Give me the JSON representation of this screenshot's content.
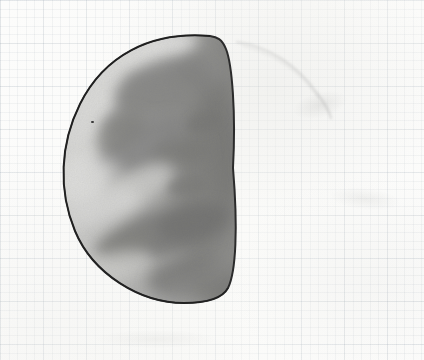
{
  "medium": {
    "support": "graph paper",
    "technique": "graphite pencil",
    "paper_color": "#fcfcfb",
    "grid_color": "#8793a0",
    "grid_spacing_px": 8.6,
    "major_grid_spacing_px": 43
  },
  "image": {
    "width": 424,
    "height": 360,
    "title": "Venus at dichotomy - pencil observation sketch",
    "subject": "Venus",
    "phase": "half phase (dichotomy)",
    "orientation": "terminator on the right, bright limb on the left"
  },
  "chart_data": {
    "type": "scatter",
    "xlabel": "",
    "ylabel": "",
    "grid": true,
    "legend_position": "none",
    "xlim": [
      0,
      424
    ],
    "ylim": [
      0,
      360
    ],
    "disk": {
      "limb_apex_x": 62,
      "north_cusp": [
        210,
        36
      ],
      "south_cusp": [
        225,
        297
      ],
      "terminator_mid_x": 233,
      "top_y": 33,
      "bottom_y": 303,
      "outline_color": "#2b2b2b",
      "outline_width_px": 2.0
    },
    "tone_scale": {
      "brightest": "#eeeeec",
      "mid": "#9a9a98",
      "darkest": "#5e5e5e"
    },
    "features": [
      {
        "name": "north polar bright cusp",
        "tone": "bright",
        "x": 150,
        "y": 52
      },
      {
        "name": "bright limb band upper-left",
        "tone": "bright",
        "x": 92,
        "y": 92
      },
      {
        "name": "dark band upper-centre",
        "tone": "dark",
        "x": 168,
        "y": 80
      },
      {
        "name": "dusky band along terminator",
        "tone": "dark",
        "x": 210,
        "y": 150
      },
      {
        "name": "bright notch mid-limb",
        "tone": "bright",
        "x": 78,
        "y": 178
      },
      {
        "name": "central dark Y marking",
        "tone": "dark",
        "x": 150,
        "y": 150
      },
      {
        "name": "oblique dark band lower-centre",
        "tone": "dark",
        "x": 160,
        "y": 235
      },
      {
        "name": "bright streak lower-left",
        "tone": "bright",
        "x": 100,
        "y": 210
      },
      {
        "name": "south cusp shading",
        "tone": "dark",
        "x": 190,
        "y": 275
      }
    ],
    "annotations": [
      {
        "name": "erased construction arc",
        "description": "faint ghost arc of the full circle outside the terminator",
        "path_start": [
          236,
          42
        ],
        "path_end": [
          328,
          118
        ]
      },
      {
        "name": "graphite speck",
        "x": 91,
        "y": 121
      }
    ]
  },
  "labels": {
    "none_visible": ""
  }
}
